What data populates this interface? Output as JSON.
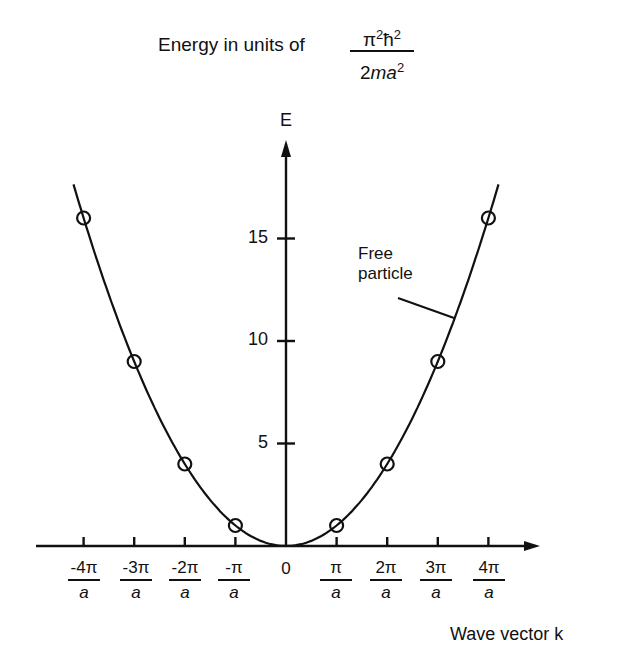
{
  "title": {
    "prefix": "Energy in units of",
    "unit_numerator": "π²ħ²",
    "unit_denominator": "2ma²"
  },
  "axes": {
    "y_label": "E",
    "x_label": "Wave vector k"
  },
  "annotation": {
    "line1": "Free",
    "line2": "particle"
  },
  "y_ticks": [
    "5",
    "10",
    "15"
  ],
  "x_ticks": [
    {
      "num": "-4π",
      "den": "a"
    },
    {
      "num": "-3π",
      "den": "a"
    },
    {
      "num": "-2π",
      "den": "a"
    },
    {
      "num": "-π",
      "den": "a"
    },
    {
      "num": "0",
      "den": ""
    },
    {
      "num": "π",
      "den": "a"
    },
    {
      "num": "2π",
      "den": "a"
    },
    {
      "num": "3π",
      "den": "a"
    },
    {
      "num": "4π",
      "den": "a"
    }
  ],
  "colors": {
    "ink": "#111111",
    "background": "#ffffff"
  },
  "chart_data": {
    "type": "line",
    "xlabel": "Wave vector k",
    "ylabel": "E",
    "x_unit": "π/a",
    "xlim": [
      -4.4,
      5.0
    ],
    "ylim": [
      0,
      19.5
    ],
    "grid": false,
    "legend": null,
    "categories": [
      "-4π/a",
      "-3π/a",
      "-2π/a",
      "-π/a",
      "0",
      "π/a",
      "2π/a",
      "3π/a",
      "4π/a"
    ],
    "series": [
      {
        "name": "Free particle",
        "kind": "curve",
        "formula": "E = k²",
        "x": [
          -4.2,
          -4,
          -3,
          -2,
          -1,
          0,
          1,
          2,
          3,
          4,
          4.2
        ],
        "values": [
          17.64,
          16,
          9,
          4,
          1,
          0,
          1,
          4,
          9,
          16,
          17.64
        ]
      },
      {
        "name": "Marked points",
        "kind": "open-circle markers",
        "x": [
          -4,
          -3,
          -2,
          -1,
          1,
          2,
          3,
          4
        ],
        "values": [
          16,
          9,
          4,
          1,
          1,
          4,
          9,
          16
        ]
      }
    ],
    "y_ticks": [
      5,
      10,
      15
    ],
    "x_ticks": [
      -4,
      -3,
      -2,
      -1,
      0,
      1,
      2,
      3,
      4
    ],
    "annotations": [
      {
        "text": "Free particle",
        "points_to": "curve near k≈3.3π/a"
      }
    ]
  }
}
